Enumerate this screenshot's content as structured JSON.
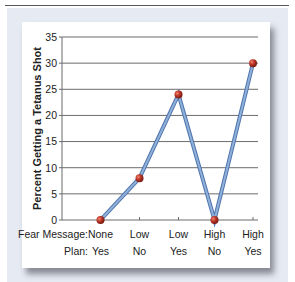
{
  "chart_data": {
    "type": "line",
    "title": "",
    "xlabel": "",
    "ylabel": "Percent Getting a Tetanus Shot",
    "ylim": [
      0,
      35
    ],
    "yticks": [
      0,
      5,
      10,
      15,
      20,
      25,
      30,
      35
    ],
    "grid": true,
    "legend": null,
    "row_labels": {
      "fear_message": "Fear Message:",
      "plan": "Plan:"
    },
    "categories": [
      {
        "fear_message": "None",
        "plan": "Yes"
      },
      {
        "fear_message": "Low",
        "plan": "No"
      },
      {
        "fear_message": "Low",
        "plan": "Yes"
      },
      {
        "fear_message": "High",
        "plan": "No"
      },
      {
        "fear_message": "High",
        "plan": "Yes"
      }
    ],
    "series": [
      {
        "name": "Percent Getting a Tetanus Shot",
        "values": [
          0,
          8,
          24,
          0,
          30
        ]
      }
    ],
    "colors": {
      "line": "#8fb0d8",
      "line_edge": "#4f74ad",
      "marker": "#c0392b",
      "grid": "#6b6b6b"
    }
  }
}
